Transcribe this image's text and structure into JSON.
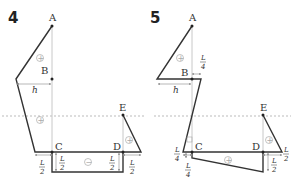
{
  "figures": [
    {
      "number": "4",
      "points": {
        "A": "A",
        "B": "B",
        "C": "C",
        "D": "D",
        "E": "E"
      },
      "dimension_h": "h",
      "signs": [
        "+",
        "+",
        "+",
        "−"
      ],
      "dimensions": [
        {
          "num": "L",
          "den": "2"
        },
        {
          "num": "L",
          "den": "2"
        },
        {
          "num": "L",
          "den": "2"
        },
        {
          "num": "L",
          "den": "2"
        }
      ]
    },
    {
      "number": "5",
      "points": {
        "A": "A",
        "B": "B",
        "C": "C",
        "D": "D",
        "E": "E"
      },
      "dimension_h": "h",
      "signs": [
        "+",
        "−",
        "+",
        "+"
      ],
      "dimensions": [
        {
          "num": "L",
          "den": "4"
        },
        {
          "num": "L",
          "den": "4"
        },
        {
          "num": "L",
          "den": "4"
        },
        {
          "num": "L",
          "den": "2"
        },
        {
          "num": "L",
          "den": "2"
        }
      ]
    }
  ]
}
